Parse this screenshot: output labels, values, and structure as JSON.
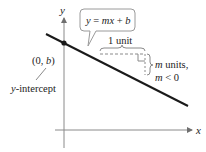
{
  "diagram": {
    "equation_callout": "y = mx + b",
    "axes": {
      "x_label": "x",
      "y_label": "y"
    },
    "point_label": "(0, b)",
    "intercept_label": "y-intercept",
    "run_label": "1 unit",
    "rise_label_line1": "m units,",
    "rise_label_line2": "m < 0",
    "colors": {
      "line": "#1a1a1a",
      "axes": "#8a8a8a",
      "dashed": "#8a8a8a",
      "callout_border": "#9a9a9a",
      "text": "#222222"
    }
  }
}
